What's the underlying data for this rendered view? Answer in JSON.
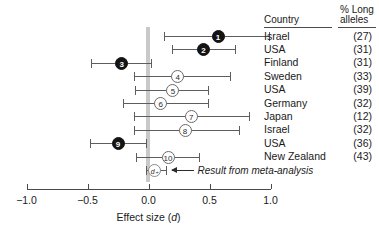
{
  "chart_data": {
    "type": "forest",
    "title": "",
    "xlabel": "Effect size (d)",
    "ylabel": "",
    "xlim": [
      -1.0,
      1.0
    ],
    "xticks": [
      -1.0,
      -0.5,
      0.0,
      0.5,
      1.0
    ],
    "xtick_labels": [
      "−1.0",
      "−0.5",
      "0.0",
      "0.5",
      "1.0"
    ],
    "grid": false,
    "legend": false,
    "zero_reference": 0.0,
    "columns": [
      "Country",
      "% Long alleles"
    ],
    "column_headers": {
      "country": "Country",
      "alleles_line1": "% Long",
      "alleles_line2": "alleles"
    },
    "studies": [
      {
        "label": "1",
        "country": "Israel",
        "alleles": "(27)",
        "effect": 0.57,
        "ci_low": 0.13,
        "ci_high": 0.99,
        "style": "filled"
      },
      {
        "label": "2",
        "country": "USA",
        "alleles": "(31)",
        "effect": 0.45,
        "ci_low": 0.19,
        "ci_high": 0.71,
        "style": "filled"
      },
      {
        "label": "3",
        "country": "Finland",
        "alleles": "(31)",
        "effect": -0.22,
        "ci_low": -0.47,
        "ci_high": 0.02,
        "style": "filled"
      },
      {
        "label": "4",
        "country": "Sweden",
        "alleles": "(33)",
        "effect": 0.24,
        "ci_low": -0.12,
        "ci_high": 0.67,
        "style": "open"
      },
      {
        "label": "5",
        "country": "USA",
        "alleles": "(39)",
        "effect": 0.2,
        "ci_low": -0.11,
        "ci_high": 0.49,
        "style": "open"
      },
      {
        "label": "6",
        "country": "Germany",
        "alleles": "(32)",
        "effect": 0.1,
        "ci_low": -0.21,
        "ci_high": 0.49,
        "style": "open"
      },
      {
        "label": "7",
        "country": "Japan",
        "alleles": "(12)",
        "effect": 0.35,
        "ci_low": -0.12,
        "ci_high": 0.82,
        "style": "open"
      },
      {
        "label": "8",
        "country": "Israel",
        "alleles": "(32)",
        "effect": 0.3,
        "ci_low": -0.12,
        "ci_high": 0.74,
        "style": "open"
      },
      {
        "label": "9",
        "country": "USA",
        "alleles": "(36)",
        "effect": -0.25,
        "ci_low": -0.48,
        "ci_high": -0.02,
        "style": "filled"
      },
      {
        "label": "10",
        "country": "New Zealand",
        "alleles": "(43)",
        "effect": 0.16,
        "ci_low": -0.1,
        "ci_high": 0.41,
        "style": "open"
      }
    ],
    "summary": {
      "label": "d₊",
      "effect": 0.05,
      "ci_low": -0.02,
      "ci_high": 0.14,
      "style": "summary",
      "annotation": "Result from meta-analysis"
    }
  }
}
